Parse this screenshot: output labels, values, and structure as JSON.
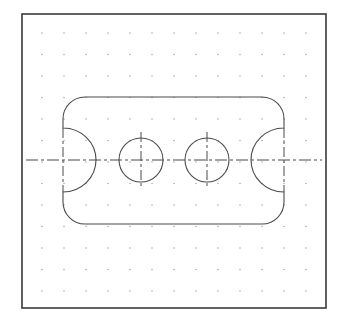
{
  "drawing": {
    "title": "Plate with two holes and end notches",
    "colors": {
      "background": "#ffffff",
      "border": "#3a3a3a",
      "outline": "#4a4a4a",
      "centerline": "#4a4a4a",
      "grid_dot": "#9a9a9a"
    },
    "frame": {
      "x": 22,
      "y": 14,
      "width": 304,
      "height": 294
    },
    "grid": {
      "x0": 42,
      "y0": 33,
      "spacing_x": 22,
      "spacing_y": 21.5,
      "cols": 13,
      "rows": 13
    },
    "centerline_y": 160,
    "profile": {
      "left": 63,
      "right": 284,
      "top": 97,
      "bottom": 224,
      "corner_radius": 22,
      "notch_top_y": 128,
      "notch_bottom_y": 192,
      "left_notch_apex_x": 96,
      "right_notch_apex_x": 251
    },
    "holes": [
      {
        "cx": 141,
        "cy": 160,
        "r": 22
      },
      {
        "cx": 207,
        "cy": 160,
        "r": 22
      }
    ],
    "notch_axes_x": [
      63,
      284
    ]
  }
}
